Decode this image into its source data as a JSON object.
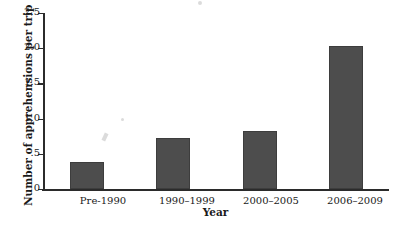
{
  "chart_data": {
    "type": "bar",
    "title": "",
    "subtitle": "",
    "xlabel": "Year",
    "ylabel": "Number of apprehensions per trip",
    "categories": [
      "Pre-1990",
      "1990–1999",
      "2000–2005",
      "2006–2009"
    ],
    "values": [
      0.35,
      0.7,
      0.8,
      2.0
    ],
    "series": [
      {
        "name": "Number of apprehensions per trip",
        "values": [
          0.35,
          0.7,
          0.8,
          2.0
        ]
      }
    ],
    "ylim": [
      0,
      2.5
    ],
    "ytick_labels": [
      "0",
      ".5",
      "1.0",
      "1.5",
      "2.0",
      "2.5"
    ],
    "ytick_values": [
      0,
      0.5,
      1.0,
      1.5,
      2.0,
      2.5
    ],
    "grid": false,
    "legend": null,
    "legend_position": "none",
    "bar_color": "#4d4d4d",
    "axis_color": "#2b2b2b",
    "background_color": "#ffffff"
  }
}
